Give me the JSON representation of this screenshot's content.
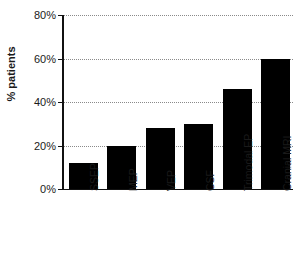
{
  "chart_data": {
    "type": "bar",
    "title": "",
    "subtitle": "",
    "xlabel": "",
    "ylabel": "% patients",
    "categories": [
      "SSEP",
      "MEP",
      "VEP",
      "CSF",
      "Trimodal EP",
      "Cranial MRI"
    ],
    "values": [
      12,
      20,
      28,
      30,
      46,
      60
    ],
    "ylim": [
      0,
      80
    ],
    "ytick_values": [
      0,
      20,
      40,
      60,
      80
    ],
    "ytick_labels": [
      "0%",
      "20%",
      "40%",
      "60%",
      "80%"
    ],
    "grid": true,
    "grid_axis": "y",
    "grid_style": "dotted",
    "legend": false,
    "legend_position": "none",
    "bar_color": "#000000",
    "axis_color": "#111111",
    "grid_color": "#8a8a8a",
    "background_color": "#ffffff",
    "tick_label_rotation": -90
  }
}
